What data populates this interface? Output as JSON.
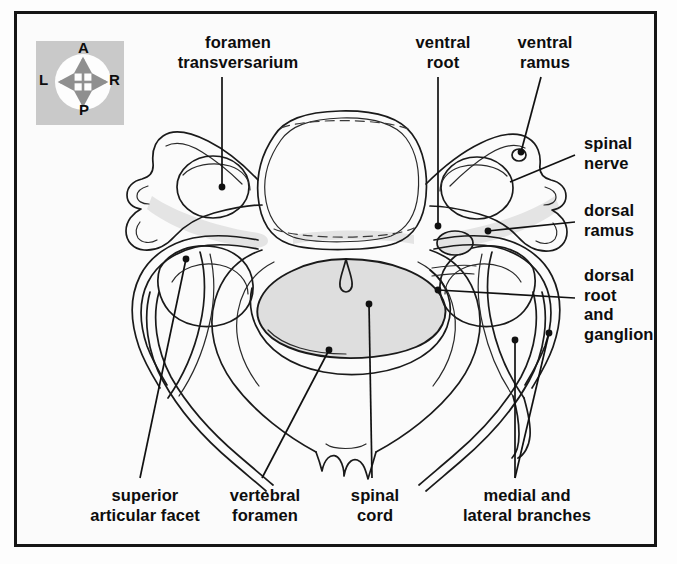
{
  "figure": {
    "frame_color": "#151515",
    "background_color": "#fbfbfb",
    "ink_color": "#1a1a1a",
    "cord_fill": "#dedede",
    "bone_shade": "#e2e2e2"
  },
  "compass": {
    "name": "orientation-compass",
    "box_color": "#c9c9c9",
    "disc_color": "#fdfdfd",
    "arrow_color": "#8f8f8f",
    "anterior": "A",
    "posterior": "P",
    "left": "L",
    "right": "R"
  },
  "labels": [
    {
      "id": "foramen-transversarium",
      "line1": "foramen",
      "line2": "transversarium",
      "x": 238,
      "y": 33
    },
    {
      "id": "ventral-root",
      "line1": "ventral",
      "line2": "root",
      "x": 443,
      "y": 33
    },
    {
      "id": "ventral-ramus",
      "line1": "ventral",
      "line2": "ramus",
      "x": 545,
      "y": 33
    },
    {
      "id": "spinal-nerve",
      "line1": "spinal",
      "line2": "nerve",
      "x": 584,
      "y": 134
    },
    {
      "id": "dorsal-ramus",
      "line1": "dorsal",
      "line2": "ramus",
      "x": 584,
      "y": 201
    },
    {
      "id": "dorsal-root-and-ganglion",
      "line1": "dorsal",
      "line2": "root",
      "line3": "and",
      "line4": "ganglion",
      "x": 584,
      "y": 266
    },
    {
      "id": "superior-articular-facet",
      "line1": "superior",
      "line2": "articular facet",
      "x": 145,
      "y": 486
    },
    {
      "id": "vertebral-foramen",
      "line1": "vertebral",
      "line2": "foramen",
      "x": 265,
      "y": 486
    },
    {
      "id": "spinal-cord",
      "line1": "spinal",
      "line2": "cord",
      "x": 375,
      "y": 486
    },
    {
      "id": "medial-and-lateral-branches",
      "line1": "medial and",
      "line2": "lateral branches",
      "x": 527,
      "y": 486
    }
  ]
}
